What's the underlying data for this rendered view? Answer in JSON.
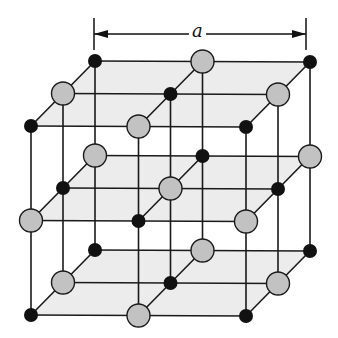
{
  "diagram": {
    "dimension_label": "a",
    "lattice": {
      "size": 3,
      "origin": [
        31,
        126
      ],
      "x_step": [
        107.5,
        0.5
      ],
      "depth_step": [
        32,
        -32.5
      ],
      "vertical_step": [
        0,
        94.5
      ]
    },
    "atoms": {
      "small": {
        "label": "small ion",
        "color": "#111111",
        "radius": 7
      },
      "large": {
        "label": "large ion",
        "color": "#c2c2c2",
        "stroke": "#1a1a1a",
        "radius": 11.5
      }
    },
    "plane_fill": "#ececec",
    "line_color": "#1a1a1a",
    "dimension_arrow": {
      "x1": 94,
      "x2": 306,
      "y": 34,
      "tick_top": 18,
      "tick_bottom": 50,
      "label_x": 198
    }
  }
}
